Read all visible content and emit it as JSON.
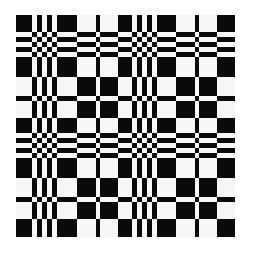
{
  "figure": {
    "colors": {
      "dark": "#0a0a0a",
      "light": "#f7f7f7",
      "background": "#ffffff"
    },
    "rule": "cell is dark when column band value equals row band value",
    "origin": {
      "x": 16,
      "y": 15
    },
    "columns": [
      {
        "w": 16,
        "v": 1
      },
      {
        "w": 5,
        "v": 0
      },
      {
        "w": 5,
        "v": 1
      },
      {
        "w": 5,
        "v": 0
      },
      {
        "w": 5,
        "v": 1
      },
      {
        "w": 5,
        "v": 0
      },
      {
        "w": 20,
        "v": 1
      },
      {
        "w": 19,
        "v": 0
      },
      {
        "w": 4,
        "v": 1
      },
      {
        "w": 18,
        "v": 0
      },
      {
        "w": 14,
        "v": 1
      },
      {
        "w": 5,
        "v": 0
      },
      {
        "w": 5,
        "v": 1
      },
      {
        "w": 5,
        "v": 0
      },
      {
        "w": 5,
        "v": 1
      },
      {
        "w": 5,
        "v": 0
      },
      {
        "w": 19,
        "v": 1
      },
      {
        "w": 19,
        "v": 0
      },
      {
        "w": 4,
        "v": 1
      },
      {
        "w": 18,
        "v": 0
      },
      {
        "w": 18,
        "v": 1
      }
    ],
    "rows": [
      {
        "h": 17,
        "v": 1
      },
      {
        "h": 5,
        "v": 0
      },
      {
        "h": 5,
        "v": 1
      },
      {
        "h": 5,
        "v": 0
      },
      {
        "h": 5,
        "v": 1
      },
      {
        "h": 5,
        "v": 0
      },
      {
        "h": 20,
        "v": 1
      },
      {
        "h": 19,
        "v": 0
      },
      {
        "h": 5,
        "v": 1
      },
      {
        "h": 17,
        "v": 0
      },
      {
        "h": 15,
        "v": 1
      },
      {
        "h": 5,
        "v": 0
      },
      {
        "h": 5,
        "v": 1
      },
      {
        "h": 5,
        "v": 0
      },
      {
        "h": 5,
        "v": 1
      },
      {
        "h": 5,
        "v": 0
      },
      {
        "h": 20,
        "v": 1
      },
      {
        "h": 19,
        "v": 0
      },
      {
        "h": 5,
        "v": 1
      },
      {
        "h": 17,
        "v": 0
      },
      {
        "h": 18,
        "v": 1
      }
    ]
  }
}
